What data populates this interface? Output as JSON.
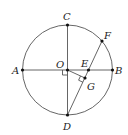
{
  "diagram": {
    "type": "geometry-circle",
    "circle": {
      "center": "O",
      "cx": 67.5,
      "cy": 70,
      "r": 45
    },
    "points": {
      "A": {
        "label": "A",
        "x": 22.5,
        "y": 70
      },
      "B": {
        "label": "B",
        "x": 112.5,
        "y": 70
      },
      "C": {
        "label": "C",
        "x": 67.5,
        "y": 25
      },
      "D": {
        "label": "D",
        "x": 67.5,
        "y": 115
      },
      "O": {
        "label": "O",
        "x": 67.5,
        "y": 70
      },
      "E": {
        "label": "E",
        "x": 88.5,
        "y": 70
      },
      "F": {
        "label": "F",
        "x": 102,
        "y": 41
      },
      "G": {
        "label": "G",
        "x": 85,
        "y": 78
      }
    },
    "segments": [
      "AB",
      "CD",
      "DF",
      "OG"
    ],
    "right_angles": [
      "at O (between OA and OD)",
      "at G (between OG and GD)"
    ],
    "colors": {
      "stroke": "#555555",
      "point": "#111111",
      "text": "#222222"
    }
  }
}
